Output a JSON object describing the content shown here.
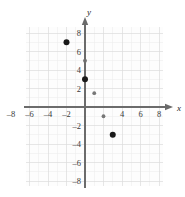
{
  "chart_data": {
    "type": "scatter",
    "title": "",
    "xlabel": "x",
    "ylabel": "y",
    "xlim": [
      -10,
      10
    ],
    "ylim": [
      -10,
      10
    ],
    "grid": true,
    "legend": "none",
    "x_ticks": [
      -8,
      -6,
      -4,
      -2,
      4,
      6,
      8
    ],
    "x_tick_labels": [
      "–8",
      "–6",
      "–4",
      "–2",
      "4",
      "6",
      "8"
    ],
    "y_ticks": [
      8,
      6,
      4,
      2,
      -2,
      -4,
      -6,
      -8
    ],
    "y_tick_labels": [
      "8",
      "6",
      "4",
      "2",
      "–2",
      "–4",
      "–6",
      "–8"
    ],
    "points": [
      {
        "x": -2,
        "y": 7,
        "r": 3.0,
        "color": "#1a1a1a"
      },
      {
        "x": 0,
        "y": 5,
        "r": 1.9,
        "color": "#6f6f6f"
      },
      {
        "x": 0,
        "y": 3,
        "r": 3.0,
        "color": "#1a1a1a"
      },
      {
        "x": 1,
        "y": 1.5,
        "r": 1.9,
        "color": "#777777"
      },
      {
        "x": 2,
        "y": -1,
        "r": 1.9,
        "color": "#777777"
      },
      {
        "x": 3,
        "y": -3,
        "r": 3.0,
        "color": "#1a1a1a"
      }
    ]
  },
  "colors": {
    "grid_minor": "#ececec",
    "grid_major": "#dcdcdc",
    "axis": "#6b6b6b",
    "point_dark": "#1a1a1a",
    "point_gray": "#777777",
    "plot_background": "#fdfdfd"
  },
  "axis_labels": {
    "x": "x",
    "y": "y"
  }
}
